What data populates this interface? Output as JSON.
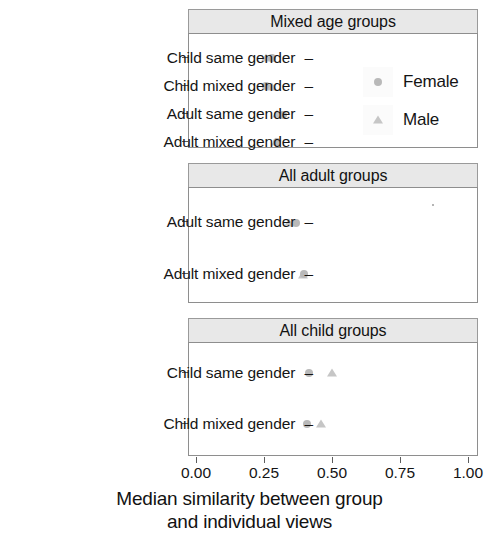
{
  "chart_data": {
    "type": "scatter",
    "title": "",
    "xlabel": "Median similarity between group and individual views",
    "xlabel_line1": "Median similarity between group",
    "xlabel_line2": "and individual views",
    "ylabel": "",
    "xlim": [
      0.0,
      1.0
    ],
    "xticks": [
      "0.00",
      "0.25",
      "0.50",
      "0.75",
      "1.00"
    ],
    "xtickvalues": [
      0.0,
      0.25,
      0.5,
      0.75,
      1.0
    ],
    "grid": false,
    "legend": {
      "position": "inside-top-right-panel1",
      "entries": [
        {
          "name": "Female",
          "marker": "circle",
          "color": "#b9b9b9"
        },
        {
          "name": "Male",
          "marker": "triangle",
          "color": "#c6c6c6"
        }
      ]
    },
    "facets": [
      {
        "strip": "Mixed age groups",
        "categories": [
          "Child same gender",
          "Child mixed gender",
          "Adult same gender",
          "Adult mixed gender"
        ],
        "series": [
          {
            "name": "Female",
            "marker": "circle",
            "values": [
              0.285,
              0.265,
              0.315,
              null
            ]
          },
          {
            "name": "Male",
            "marker": "triangle",
            "values": [
              0.265,
              0.285,
              0.295,
              0.295
            ]
          }
        ]
      },
      {
        "strip": "All adult groups",
        "categories": [
          "Adult same gender",
          "Adult mixed gender"
        ],
        "series": [
          {
            "name": "Female",
            "marker": "circle",
            "values": [
              0.365,
              0.385
            ]
          },
          {
            "name": "Male",
            "marker": "triangle",
            "values": [
              0.34,
              0.38
            ]
          }
        ]
      },
      {
        "strip": "All child groups",
        "categories": [
          "Child same gender",
          "Child mixed gender"
        ],
        "series": [
          {
            "name": "Female",
            "marker": "circle",
            "values": [
              0.415,
              0.405
            ]
          },
          {
            "name": "Male",
            "marker": "triangle",
            "values": [
              0.5,
              0.455
            ]
          }
        ]
      }
    ]
  },
  "panels": [
    {
      "strip_label": "Mixed age groups",
      "rows": [
        {
          "label": "Child same gender"
        },
        {
          "label": "Child mixed gender"
        },
        {
          "label": "Adult same gender"
        },
        {
          "label": "Adult mixed gender"
        }
      ]
    },
    {
      "strip_label": "All adult groups",
      "rows": [
        {
          "label": "Adult same gender"
        },
        {
          "label": "Adult mixed gender"
        }
      ]
    },
    {
      "strip_label": "All child groups",
      "rows": [
        {
          "label": "Child same gender"
        },
        {
          "label": "Child mixed gender"
        }
      ]
    }
  ],
  "axis": {
    "tick_dash": "–",
    "x_tick_labels": [
      "0.00",
      "0.25",
      "0.50",
      "0.75",
      "1.00"
    ],
    "x_title_line1": "Median similarity between group",
    "x_title_line2": "and individual views"
  },
  "legend": {
    "female_label": "Female",
    "male_label": "Male"
  }
}
